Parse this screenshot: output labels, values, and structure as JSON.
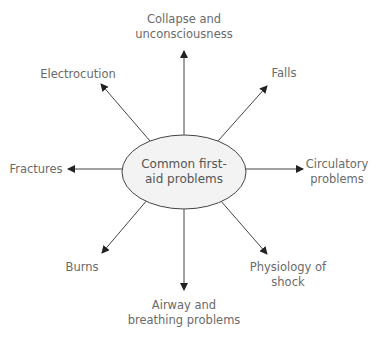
{
  "diagram": {
    "center": {
      "lines": [
        "Common first-",
        "aid problems"
      ]
    },
    "nodes": [
      {
        "id": "collapse",
        "lines": [
          "Collapse and",
          "unconsciousness"
        ]
      },
      {
        "id": "falls",
        "lines": [
          "Falls"
        ]
      },
      {
        "id": "circulatory",
        "lines": [
          "Circulatory",
          "problems"
        ]
      },
      {
        "id": "shock",
        "lines": [
          "Physiology of",
          "shock"
        ]
      },
      {
        "id": "airway",
        "lines": [
          "Airway and",
          "breathing problems"
        ]
      },
      {
        "id": "burns",
        "lines": [
          "Burns"
        ]
      },
      {
        "id": "fractures",
        "lines": [
          "Fractures"
        ]
      },
      {
        "id": "electrocution",
        "lines": [
          "Electrocution"
        ]
      }
    ],
    "colors": {
      "text": "#6a6a6a",
      "line": "#333333",
      "ellipse_fill": "#f3f3f3",
      "ellipse_stroke": "#444444"
    }
  }
}
